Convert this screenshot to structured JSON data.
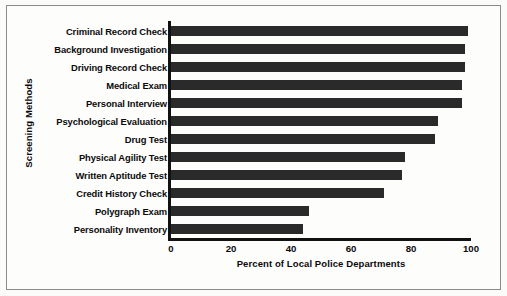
{
  "chart_data": {
    "type": "bar",
    "orientation": "horizontal",
    "title": "",
    "xlabel": "Percent of Local Police Departments",
    "ylabel": "Screening Methods",
    "categories": [
      "Criminal Record Check",
      "Background Investigation",
      "Driving Record Check",
      "Medical Exam",
      "Personal Interview",
      "Psychological Evaluation",
      "Drug Test",
      "Physical Agility Test",
      "Written Aptitude Test",
      "Credit History Check",
      "Polygraph Exam",
      "Personality Inventory"
    ],
    "values": [
      99,
      98,
      98,
      97,
      97,
      89,
      88,
      78,
      77,
      71,
      46,
      44
    ],
    "xlim": [
      0,
      100
    ],
    "xticks": [
      0,
      20,
      40,
      60,
      80,
      100
    ],
    "xticklabels": [
      "0",
      "20",
      "40",
      "60",
      "80",
      "100"
    ],
    "grid": false,
    "legend": null,
    "bar_color": "#2a2a2a",
    "axis_color": "#111111",
    "background": "#fdfdfc"
  }
}
